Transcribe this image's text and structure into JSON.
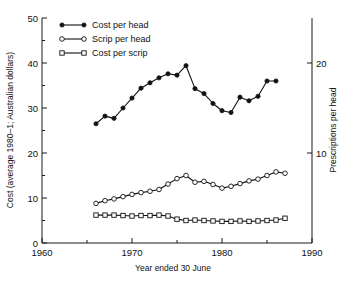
{
  "chart_data": {
    "type": "line",
    "title": "",
    "xlabel": "Year ended 30 June",
    "ylabel": "Cost (average 1980–1; Australian dollars)",
    "ylabel_right": "Prescriptions per head",
    "xlim": [
      1960,
      1990
    ],
    "ylim": [
      0,
      50
    ],
    "ylim_right": [
      0,
      25
    ],
    "grid": false,
    "legend_position": "top-left",
    "xticks": [
      1960,
      1970,
      1980,
      1990
    ],
    "xticks_minor": [
      1965,
      1975,
      1985
    ],
    "yticks": [
      0,
      10,
      20,
      30,
      40,
      50
    ],
    "yticks_minor": [
      5,
      15,
      25,
      35,
      45
    ],
    "yticks_right": [
      10,
      20
    ],
    "x": [
      1966,
      1967,
      1968,
      1969,
      1970,
      1971,
      1972,
      1973,
      1974,
      1975,
      1976,
      1977,
      1978,
      1979,
      1980,
      1981,
      1982,
      1983,
      1984,
      1985,
      1986,
      1987
    ],
    "series": [
      {
        "name": "Cost per head",
        "marker": "filled-circle",
        "axis": "left",
        "x": [
          1966,
          1967,
          1968,
          1969,
          1970,
          1971,
          1972,
          1973,
          1974,
          1975,
          1976,
          1977,
          1978,
          1979,
          1980,
          1981,
          1982,
          1983,
          1984,
          1985,
          1986
        ],
        "values": [
          26.5,
          28.2,
          27.7,
          30.0,
          32.2,
          34.4,
          35.6,
          36.7,
          37.6,
          37.3,
          39.4,
          34.3,
          33.2,
          31.0,
          29.4,
          29.0,
          32.4,
          31.6,
          32.6,
          36.0,
          36.0
        ]
      },
      {
        "name": "Scrip per head",
        "marker": "open-circle",
        "axis": "right",
        "x": [
          1966,
          1967,
          1968,
          1969,
          1970,
          1971,
          1972,
          1973,
          1974,
          1975,
          1976,
          1977,
          1978,
          1979,
          1980,
          1981,
          1982,
          1983,
          1984,
          1985,
          1986,
          1987
        ],
        "values_left_scale": [
          8.8,
          9.4,
          9.8,
          10.3,
          10.8,
          11.2,
          11.5,
          11.9,
          13.1,
          14.3,
          15.0,
          13.5,
          13.7,
          13.0,
          12.2,
          12.6,
          13.2,
          13.8,
          14.2,
          15.0,
          15.8,
          15.5
        ],
        "values": [
          4.4,
          4.7,
          4.9,
          5.15,
          5.4,
          5.6,
          5.75,
          5.95,
          6.55,
          7.15,
          7.5,
          6.75,
          6.85,
          6.5,
          6.1,
          6.3,
          6.6,
          6.9,
          7.1,
          7.5,
          7.9,
          7.75
        ]
      },
      {
        "name": "Cost per scrip",
        "marker": "open-square",
        "axis": "left",
        "x": [
          1966,
          1967,
          1968,
          1969,
          1970,
          1971,
          1972,
          1973,
          1974,
          1975,
          1976,
          1977,
          1978,
          1979,
          1980,
          1981,
          1982,
          1983,
          1984,
          1985,
          1986,
          1987
        ],
        "values": [
          6.2,
          6.2,
          6.2,
          6.1,
          6.0,
          6.1,
          6.1,
          6.2,
          6.0,
          5.3,
          5.0,
          5.1,
          5.0,
          4.9,
          4.8,
          4.8,
          4.9,
          4.8,
          4.9,
          5.0,
          5.1,
          5.5
        ]
      }
    ]
  },
  "legend": {
    "items": [
      {
        "label": "Cost per head"
      },
      {
        "label": "Scrip per head"
      },
      {
        "label": "Cost per scrip"
      }
    ]
  }
}
